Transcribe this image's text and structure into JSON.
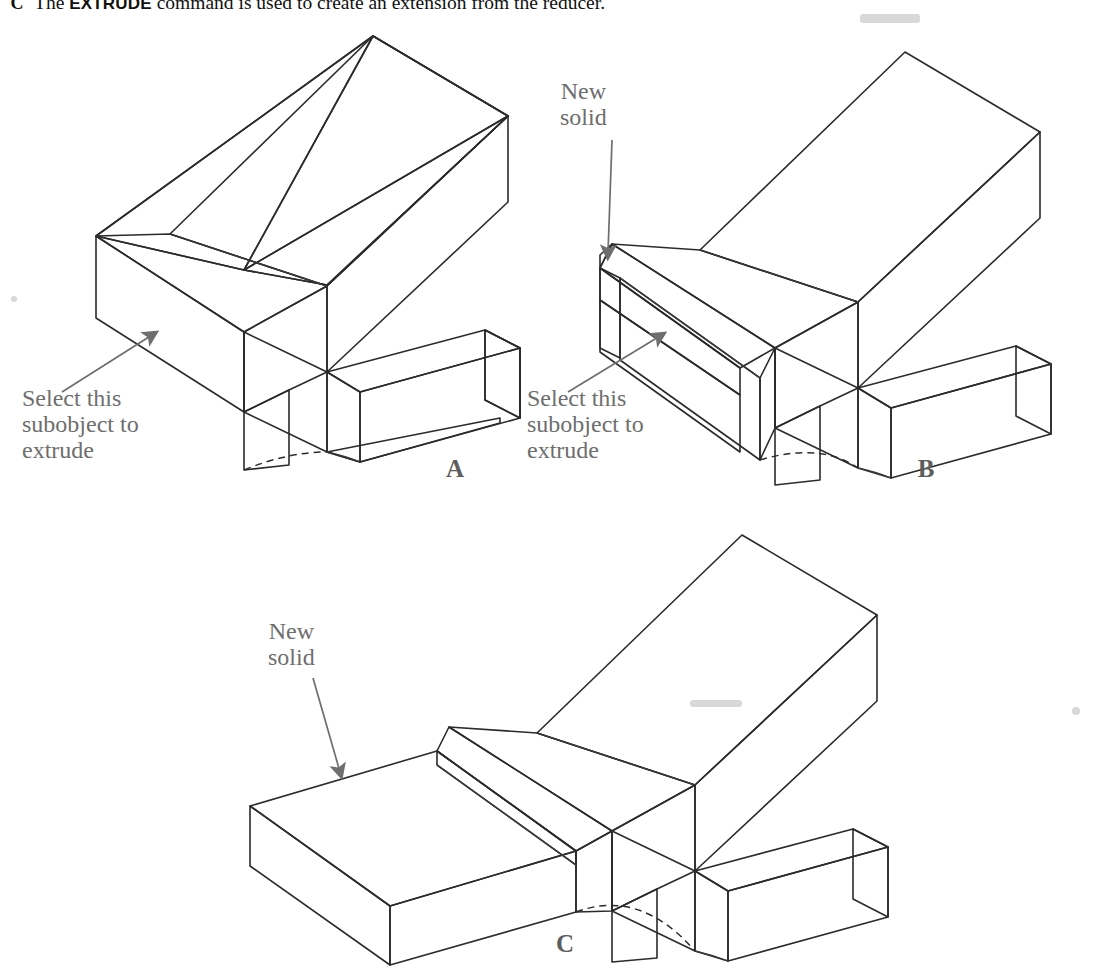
{
  "figure": {
    "caption": {
      "letter": "C",
      "text_before": "The ",
      "command": "EXTRUDE",
      "text_after": " command is used to create an extension from the reducer."
    },
    "panels": [
      {
        "id": "A",
        "letter": "A",
        "description": "Reducer solid with the face to be extruded highlighted",
        "callouts": [
          {
            "name": "select-subobject",
            "text": "Select this\nsubobject to\nextrude",
            "align": "left"
          }
        ]
      },
      {
        "id": "B",
        "letter": "B",
        "description": "Reducer solid after a short extrusion creating a new solid",
        "callouts": [
          {
            "name": "new-solid",
            "text": "New\nsolid",
            "align": "center"
          },
          {
            "name": "select-subobject",
            "text": "Select this\nsubobject to\nextrude",
            "align": "left"
          }
        ]
      },
      {
        "id": "C",
        "letter": "C",
        "description": "Reducer solid after the full extrusion creating the new solid arm",
        "callouts": [
          {
            "name": "new-solid",
            "text": "New\nsolid",
            "align": "center"
          }
        ]
      }
    ],
    "colors": {
      "face_top_light": "#dedede",
      "face_top_light2": "#d6d6d6",
      "face_front_medium": "#bdbdbd",
      "face_front_medium2": "#b2b2b2",
      "face_side_dark": "#8e8e8e",
      "face_side_dark2": "#868686",
      "edge": "#2b2b2b",
      "label_text": "#6e6e6e",
      "background": "#ffffff"
    }
  }
}
